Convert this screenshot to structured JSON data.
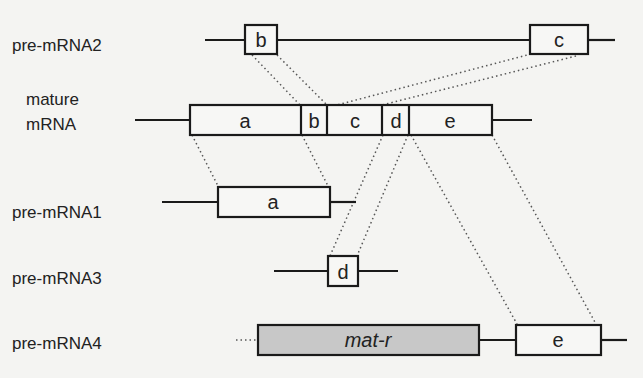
{
  "diagram": {
    "title": "",
    "colors": {
      "background": "#f4f4f2",
      "exon_fill": "#f7f7f5",
      "mat_r_fill": "#c8c8c8",
      "stroke": "#1a1a1a"
    },
    "rows": [
      {
        "id": "pre-mRNA2",
        "label": "pre-mRNA2",
        "exons": [
          "b",
          "c"
        ]
      },
      {
        "id": "mature-mRNA",
        "label_line1": "mature",
        "label_line2": "mRNA",
        "exons": [
          "a",
          "b",
          "c",
          "d",
          "e"
        ]
      },
      {
        "id": "pre-mRNA1",
        "label": "pre-mRNA1",
        "exons": [
          "a"
        ]
      },
      {
        "id": "pre-mRNA3",
        "label": "pre-mRNA3",
        "exons": [
          "d"
        ]
      },
      {
        "id": "pre-mRNA4",
        "label": "pre-mRNA4",
        "exons": [
          "mat-r",
          "e"
        ]
      }
    ],
    "exon_labels": {
      "a": "a",
      "b": "b",
      "c": "c",
      "d": "d",
      "e": "e",
      "mat_r": "mat-r"
    }
  }
}
